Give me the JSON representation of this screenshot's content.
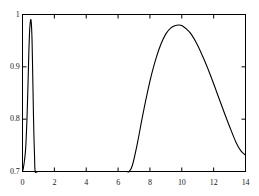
{
  "chart_data": {
    "type": "line",
    "title": "",
    "xlabel": "",
    "ylabel": "",
    "xlim": [
      0,
      14
    ],
    "ylim": [
      0.7,
      1.0
    ],
    "grid": false,
    "legend": null,
    "x_ticks": [
      0,
      2,
      4,
      6,
      8,
      10,
      12,
      14
    ],
    "x_tick_labels": [
      "0",
      "2",
      "4",
      "6",
      "8",
      "10",
      "12",
      "14"
    ],
    "y_ticks": [
      0.7,
      0.8,
      0.9,
      1.0
    ],
    "y_tick_labels": [
      "0.7",
      "0.8",
      "0.9",
      "1"
    ],
    "line_color": "#000000",
    "frame_color": "#000000",
    "background": "#ffffff",
    "series": [
      {
        "name": "curve",
        "comment": "bimodal curve: narrow spike near x=0.55 plus broad hump peaking near x=9.8",
        "x": [
          0.0,
          0.05,
          0.12,
          0.2,
          0.28,
          0.34,
          0.4,
          0.44,
          0.48,
          0.51,
          0.54,
          0.57,
          0.6,
          0.63,
          0.66,
          0.69,
          0.72,
          0.76,
          0.8,
          1.0,
          2.0,
          3.0,
          4.0,
          5.0,
          6.0,
          6.5,
          6.7,
          6.9,
          7.2,
          7.5,
          7.8,
          8.1,
          8.4,
          8.7,
          9.0,
          9.3,
          9.6,
          9.8,
          10.0,
          10.3,
          10.6,
          11.0,
          11.4,
          11.8,
          12.2,
          12.6,
          13.0,
          13.4,
          13.7,
          14.0
        ],
        "y": [
          0.7,
          0.706,
          0.72,
          0.745,
          0.8,
          0.86,
          0.93,
          0.965,
          0.983,
          0.99,
          0.988,
          0.975,
          0.95,
          0.905,
          0.855,
          0.805,
          0.765,
          0.725,
          0.7,
          0.7,
          0.7,
          0.7,
          0.7,
          0.7,
          0.7,
          0.7,
          0.7,
          0.712,
          0.752,
          0.8,
          0.845,
          0.885,
          0.918,
          0.944,
          0.963,
          0.974,
          0.979,
          0.98,
          0.979,
          0.972,
          0.962,
          0.941,
          0.914,
          0.884,
          0.851,
          0.818,
          0.786,
          0.756,
          0.74,
          0.731
        ]
      }
    ]
  },
  "axes": {
    "x_labels": [
      "0",
      "2",
      "4",
      "6",
      "8",
      "10",
      "12",
      "14"
    ],
    "y_labels": [
      "1",
      "0.9",
      "0.8",
      "0.7"
    ]
  }
}
